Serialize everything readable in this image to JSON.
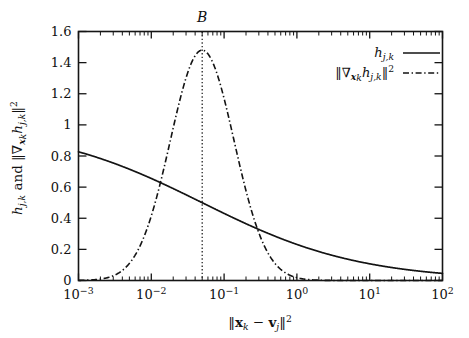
{
  "chart_data": {
    "type": "line",
    "title": "",
    "annotation_top": "B",
    "xlabel": "‖x_k − v_j‖²",
    "ylabel": "h_{j,k} and ‖∇_{x_k} h_{j,k}‖²",
    "xscale": "log",
    "yscale": "linear",
    "xlim": [
      0.001,
      100
    ],
    "ylim": [
      0,
      1.6
    ],
    "grid": false,
    "legend_position": "top-right",
    "x_tick_labels": [
      "10⁻³",
      "10⁻²",
      "10⁻¹",
      "10⁰",
      "10¹",
      "10²"
    ],
    "x_tick_exponents": [
      "-3",
      "-2",
      "-1",
      "0",
      "1",
      "2"
    ],
    "x_tick_values": [
      0.001,
      0.01,
      0.1,
      1,
      10,
      100
    ],
    "y_tick_labels": [
      "0",
      "0.2",
      "0.4",
      "0.6",
      "0.8",
      "1",
      "1.2",
      "1.4",
      "1.6"
    ],
    "y_tick_values": [
      0,
      0.2,
      0.4,
      0.6,
      0.8,
      1.0,
      1.2,
      1.4,
      1.6
    ],
    "vertical_marker_x": 0.05,
    "series": [
      {
        "name": "h_{j,k}",
        "style": "solid",
        "model": "sigmoid_log",
        "params": {
          "B": 0.05,
          "m": 0.4,
          "amplitude": 1.0
        },
        "x": [
          0.001,
          0.002,
          0.005,
          0.01,
          0.02,
          0.05,
          0.1,
          0.2,
          0.3,
          0.5,
          1,
          2,
          5,
          10,
          20,
          50,
          100
        ],
        "values": [
          1.0,
          0.99,
          0.97,
          0.94,
          0.89,
          0.82,
          0.73,
          0.62,
          0.55,
          0.45,
          0.33,
          0.23,
          0.13,
          0.085,
          0.055,
          0.032,
          0.028
        ]
      },
      {
        "name": "‖∇_{x_k} h_{j,k}‖²",
        "style": "dash-dot",
        "model": "bell_log",
        "params": {
          "B": 0.05,
          "peak": 1.48,
          "width_decades": 0.62
        },
        "x": [
          0.001,
          0.002,
          0.005,
          0.01,
          0.02,
          0.035,
          0.05,
          0.07,
          0.1,
          0.15,
          0.2,
          0.3,
          0.5,
          1,
          2,
          5,
          10,
          100
        ],
        "values": [
          0.1,
          0.18,
          0.34,
          0.56,
          0.93,
          1.33,
          1.48,
          1.36,
          1.06,
          0.74,
          0.55,
          0.32,
          0.16,
          0.055,
          0.02,
          0.008,
          0.004,
          0.0
        ]
      }
    ],
    "legend": [
      {
        "label": "h_{j,k}",
        "style": "solid"
      },
      {
        "label": "‖∇_{x_k} h_{j,k}‖²",
        "style": "dash-dot"
      }
    ]
  },
  "labels": {
    "y_axis_prefix": "h",
    "y_axis_sub1": "j,k",
    "y_axis_and": " and ",
    "x_axis_x": "x",
    "x_axis_x_sub": "k",
    "x_axis_minus": " − ",
    "x_axis_v": "v",
    "x_axis_v_sub": "j",
    "marker_label": "B",
    "nabla": "∇",
    "norm_bar": "‖",
    "sup_two": "2",
    "h_sym": "h",
    "sub_jk": "j,k",
    "sub_k": "k"
  }
}
